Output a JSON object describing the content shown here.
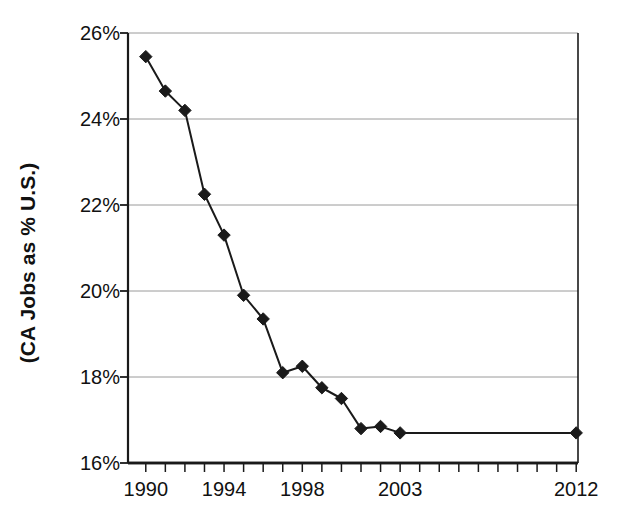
{
  "chart_data": {
    "type": "line",
    "title": "",
    "xlabel": "",
    "ylabel": "(CA Jobs as % U.S.)",
    "ylim": [
      16,
      26
    ],
    "ytick_values": [
      16,
      18,
      20,
      22,
      24,
      26
    ],
    "ytick_labels": [
      "16%",
      "18%",
      "20%",
      "22%",
      "24%",
      "26%"
    ],
    "xlim": [
      1990,
      2012
    ],
    "xtick_values": [
      1990,
      1994,
      1998,
      2003,
      2012
    ],
    "xtick_labels": [
      "1990",
      "1994",
      "1998",
      "2003",
      "2012"
    ],
    "grid": "horizontal",
    "legend": "none",
    "marker": "diamond",
    "marker_color": "#1a1a1a",
    "line_color": "#1a1a1a",
    "categories": [
      1990,
      1991,
      1992,
      1993,
      1994,
      1995,
      1996,
      1997,
      1998,
      1999,
      2000,
      2001,
      2002,
      2003,
      2004,
      2005,
      2006,
      2007,
      2008,
      2009,
      2010,
      2011,
      2012
    ],
    "values": [
      25.45,
      24.65,
      24.2,
      22.25,
      21.3,
      19.9,
      19.35,
      18.1,
      18.25,
      17.75,
      17.5,
      16.8,
      16.85,
      16.7,
      null,
      null,
      null,
      null,
      null,
      null,
      null,
      null,
      16.7
    ],
    "series": [
      {
        "name": "CA Jobs as % U.S.",
        "points": [
          {
            "x": 1990,
            "y": 25.45
          },
          {
            "x": 1991,
            "y": 24.65
          },
          {
            "x": 1992,
            "y": 24.2
          },
          {
            "x": 1993,
            "y": 22.25
          },
          {
            "x": 1994,
            "y": 21.3
          },
          {
            "x": 1995,
            "y": 19.9
          },
          {
            "x": 1996,
            "y": 19.35
          },
          {
            "x": 1997,
            "y": 18.1
          },
          {
            "x": 1998,
            "y": 18.25
          },
          {
            "x": 1999,
            "y": 17.75
          },
          {
            "x": 2000,
            "y": 17.5
          },
          {
            "x": 2001,
            "y": 16.8
          },
          {
            "x": 2002,
            "y": 16.85
          },
          {
            "x": 2003,
            "y": 16.7
          },
          {
            "x": 2012,
            "y": 16.7
          }
        ]
      }
    ]
  },
  "axis": {
    "y_title": "(CA Jobs as % U.S.)"
  },
  "colors": {
    "background": "#ffffff",
    "axis": "#1a1a1a",
    "grid": "#9a9a9a",
    "series": "#1a1a1a",
    "text": "#111111"
  }
}
